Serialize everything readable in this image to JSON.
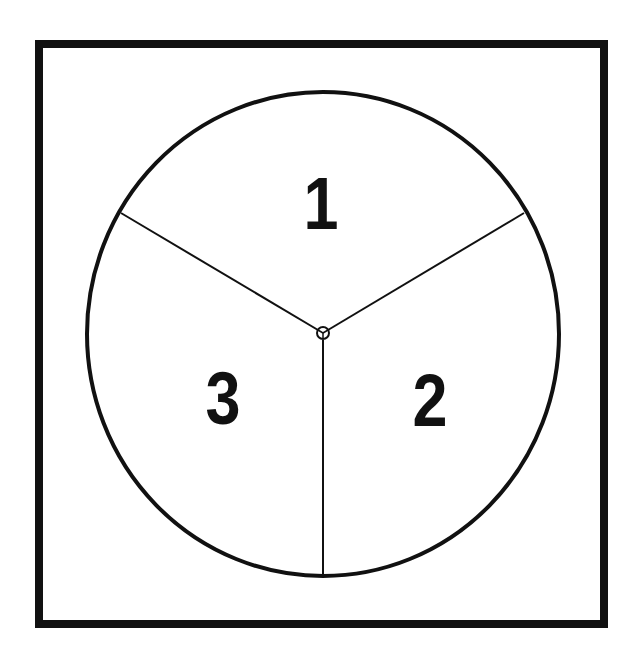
{
  "diagram": {
    "type": "spinner",
    "sections": [
      {
        "id": 1,
        "label": "1"
      },
      {
        "id": 2,
        "label": "2"
      },
      {
        "id": 3,
        "label": "3"
      }
    ],
    "colors": {
      "stroke": "#111111",
      "background": "#ffffff"
    }
  }
}
